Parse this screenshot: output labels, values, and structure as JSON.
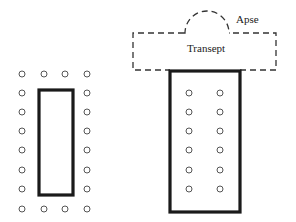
{
  "diagram": {
    "type": "architectural-floor-plan",
    "labels": {
      "apse": "Apse",
      "transept": "Transept"
    },
    "colors": {
      "line": "#1a1a1a",
      "dashed": "#333333",
      "column": "#555555",
      "background": "#ffffff"
    },
    "left_plan": {
      "description": "peripteral temple plan: cella surrounded by colonnade",
      "cella": {
        "x": 39,
        "y": 90,
        "w": 34,
        "h": 105
      },
      "columns": [
        [
          22,
          74
        ],
        [
          44,
          74
        ],
        [
          65,
          74
        ],
        [
          87,
          74
        ],
        [
          22,
          93
        ],
        [
          87,
          93
        ],
        [
          22,
          112
        ],
        [
          87,
          112
        ],
        [
          22,
          131
        ],
        [
          87,
          131
        ],
        [
          22,
          150
        ],
        [
          87,
          150
        ],
        [
          22,
          170
        ],
        [
          87,
          170
        ],
        [
          22,
          189
        ],
        [
          87,
          189
        ],
        [
          22,
          209
        ],
        [
          44,
          209
        ],
        [
          65,
          209
        ],
        [
          87,
          209
        ]
      ]
    },
    "right_plan": {
      "description": "basilica plan: nave with internal colonnades, dashed transept and apse",
      "nave": {
        "x": 170,
        "y": 71,
        "w": 70,
        "h": 141
      },
      "transept": {
        "x": 133,
        "y": 33,
        "w": 143,
        "h": 37
      },
      "apse": {
        "cx": 207,
        "cy": 33,
        "r": 22
      },
      "columns": [
        [
          189,
          93
        ],
        [
          220,
          93
        ],
        [
          189,
          112
        ],
        [
          220,
          112
        ],
        [
          189,
          131
        ],
        [
          220,
          131
        ],
        [
          189,
          150
        ],
        [
          220,
          150
        ],
        [
          189,
          170
        ],
        [
          220,
          170
        ],
        [
          189,
          189
        ],
        [
          220,
          189
        ]
      ]
    }
  }
}
